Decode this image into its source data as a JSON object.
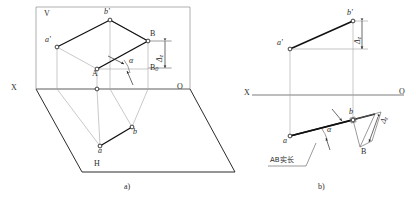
{
  "figure": {
    "subfigures": [
      {
        "id": "a",
        "caption": "a)",
        "kind": "axonometric-projection-planes"
      },
      {
        "id": "b",
        "caption": "b)",
        "kind": "orthographic-two-view"
      }
    ]
  },
  "colors": {
    "ink": "#2b2b2b",
    "thin": "#9a9a9a",
    "heavy": "#111111",
    "paper": "#ffffff"
  },
  "figure_a": {
    "caption": "a)",
    "plane_labels": {
      "v": "V",
      "h": "H"
    },
    "axis_labels": {
      "x": "X",
      "o": "O"
    },
    "points": {
      "a_prime": "a'",
      "b_prime": "b'",
      "A": "A",
      "B": "B",
      "B0": "B",
      "B0_sub": "0",
      "a": "a",
      "b": "b"
    },
    "angle_label": "α",
    "delta_label": "Δ",
    "delta_sub": "z"
  },
  "figure_b": {
    "caption": "b)",
    "axis_labels": {
      "x": "X",
      "o": "O"
    },
    "points": {
      "a_prime": "a'",
      "b_prime": "b'",
      "a": "a",
      "b": "b",
      "B": "B"
    },
    "angle_label": "α",
    "delta_top_label": "Δ",
    "delta_top_sub": "z",
    "delta_low_label": "Δ",
    "delta_low_sub": "z",
    "note": "AB实长"
  }
}
